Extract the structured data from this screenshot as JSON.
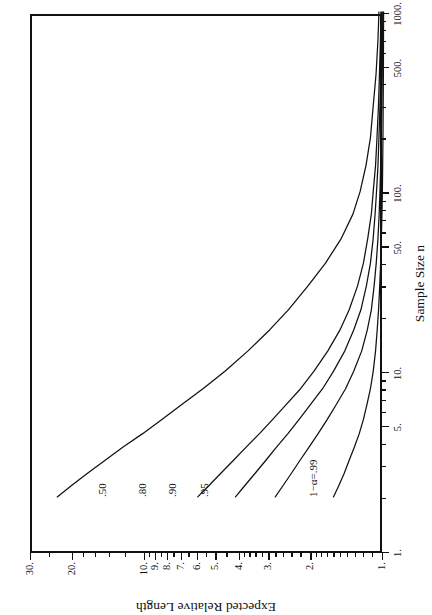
{
  "figure": {
    "background_color": "#ffffff",
    "ink_color": "#111111",
    "rotation_note": "figure is printed rotated 90 degrees counter-clockwise on the page"
  },
  "chart_data": {
    "type": "line",
    "title": "",
    "subtitle": "",
    "xlabel": "Sample Size n",
    "ylabel": "Expected Relative Length",
    "xscale": "log",
    "yscale": "log",
    "xlim": [
      1,
      1000
    ],
    "ylim": [
      1,
      30
    ],
    "grid": false,
    "legend_position": "inline-curve-labels",
    "x_ticks": [
      {
        "value": 1,
        "label": "1."
      },
      {
        "value": 5,
        "label": "5."
      },
      {
        "value": 10,
        "label": "10."
      },
      {
        "value": 50,
        "label": "50."
      },
      {
        "value": 100,
        "label": "100."
      },
      {
        "value": 500,
        "label": "500."
      },
      {
        "value": 1000,
        "label": "1000."
      }
    ],
    "y_ticks": [
      {
        "value": 1,
        "label": "1."
      },
      {
        "value": 2,
        "label": "2."
      },
      {
        "value": 3,
        "label": "3."
      },
      {
        "value": 4,
        "label": "4."
      },
      {
        "value": 5,
        "label": "5."
      },
      {
        "value": 6,
        "label": "6."
      },
      {
        "value": 7,
        "label": "7."
      },
      {
        "value": 8,
        "label": "8."
      },
      {
        "value": 9,
        "label": "9."
      },
      {
        "value": 10,
        "label": "10."
      },
      {
        "value": 20,
        "label": "20."
      },
      {
        "value": 30,
        "label": "30."
      }
    ],
    "x_minor_ticks": [
      2,
      3,
      4,
      6,
      7,
      8,
      9,
      20,
      30,
      40,
      60,
      70,
      80,
      90,
      200,
      300,
      400,
      600,
      700,
      800,
      900
    ],
    "y_minor_ticks": [
      1.1,
      1.2,
      1.3,
      1.4,
      1.5,
      1.6,
      1.7,
      1.8,
      1.9,
      2.2,
      2.4,
      2.6,
      2.8,
      3.2,
      3.4,
      3.6,
      3.8,
      4.5,
      5.5,
      6.5,
      7.5,
      8.5,
      9.5,
      12,
      14,
      16,
      18,
      25
    ],
    "annotations": [
      {
        "text": "1−α=.99",
        "x": 2.05,
        "y": 1.95
      },
      {
        "text": ".95",
        "x": 2.05,
        "y": 5.6
      },
      {
        "text": ".90",
        "x": 2.05,
        "y": 7.6
      },
      {
        "text": ".80",
        "x": 2.05,
        "y": 10.2
      },
      {
        "text": ".50",
        "x": 2.05,
        "y": 15.0
      }
    ],
    "series": [
      {
        "name": "1−α=.99",
        "label": "1−α=.99",
        "color": "#111111",
        "x": [
          2.0,
          2.3,
          2.7,
          3.2,
          3.8,
          4.5,
          5.4,
          6.5,
          8,
          10,
          13,
          17,
          22,
          30,
          40,
          55,
          75,
          100,
          140,
          200,
          300,
          450,
          700,
          1000
        ],
        "y": [
          23.5,
          20.6,
          17.6,
          14.8,
          12.4,
          10.3,
          8.55,
          7.1,
          5.75,
          4.65,
          3.72,
          3.02,
          2.52,
          2.08,
          1.76,
          1.51,
          1.35,
          1.26,
          1.19,
          1.14,
          1.11,
          1.08,
          1.06,
          1.05
        ]
      },
      {
        "name": ".95",
        "label": ".95",
        "color": "#111111",
        "x": [
          2.0,
          2.3,
          2.7,
          3.2,
          3.8,
          4.5,
          5.4,
          6.5,
          8,
          10,
          13,
          17,
          22,
          30,
          40,
          55,
          75,
          100,
          140,
          200,
          300,
          450,
          700,
          1000
        ],
        "y": [
          6.05,
          5.45,
          4.85,
          4.28,
          3.78,
          3.33,
          2.93,
          2.58,
          2.24,
          1.97,
          1.72,
          1.53,
          1.4,
          1.29,
          1.22,
          1.17,
          1.13,
          1.11,
          1.085,
          1.07,
          1.055,
          1.045,
          1.035,
          1.03
        ]
      },
      {
        "name": ".90",
        "label": ".90",
        "color": "#111111",
        "x": [
          2.0,
          2.3,
          2.7,
          3.2,
          3.8,
          4.5,
          5.4,
          6.5,
          8,
          10,
          13,
          17,
          22,
          30,
          40,
          55,
          75,
          100,
          140,
          200,
          300,
          450,
          700,
          1000
        ],
        "y": [
          4.2,
          3.85,
          3.48,
          3.13,
          2.82,
          2.53,
          2.27,
          2.04,
          1.81,
          1.63,
          1.46,
          1.34,
          1.25,
          1.185,
          1.14,
          1.11,
          1.09,
          1.075,
          1.06,
          1.05,
          1.04,
          1.032,
          1.026,
          1.022
        ]
      },
      {
        "name": ".80",
        "label": ".80",
        "color": "#111111",
        "x": [
          2.0,
          2.3,
          2.7,
          3.2,
          3.8,
          4.5,
          5.4,
          6.5,
          8,
          10,
          13,
          17,
          22,
          30,
          40,
          55,
          75,
          100,
          140,
          200,
          300,
          450,
          700,
          1000
        ],
        "y": [
          2.86,
          2.66,
          2.45,
          2.25,
          2.06,
          1.89,
          1.73,
          1.59,
          1.45,
          1.34,
          1.24,
          1.175,
          1.13,
          1.1,
          1.078,
          1.06,
          1.048,
          1.04,
          1.033,
          1.027,
          1.021,
          1.017,
          1.014,
          1.012
        ]
      },
      {
        "name": ".50",
        "label": ".50",
        "color": "#111111",
        "x": [
          2.0,
          2.3,
          2.7,
          3.2,
          3.8,
          4.5,
          5.4,
          6.5,
          8,
          10,
          13,
          17,
          22,
          30,
          40,
          55,
          75,
          100,
          140,
          200,
          300,
          450,
          700,
          1000
        ],
        "y": [
          1.63,
          1.55,
          1.47,
          1.4,
          1.33,
          1.27,
          1.22,
          1.18,
          1.14,
          1.11,
          1.085,
          1.068,
          1.054,
          1.042,
          1.033,
          1.026,
          1.02,
          1.016,
          1.013,
          1.01,
          1.008,
          1.006,
          1.005,
          1.004
        ]
      }
    ]
  }
}
